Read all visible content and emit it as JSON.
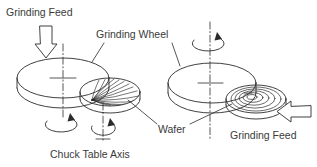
{
  "figure": {
    "title": "",
    "background_color": "#ffffff",
    "line_color": "#2b2b2b",
    "text_color": "#3a3a3a",
    "width": 317,
    "height": 167
  },
  "labels": {
    "grinding_feed_top": "Grinding Feed",
    "grinding_wheel": "Grinding Wheel",
    "wafer": "Wafer",
    "chuck_table_axis": "Chuck Table Axis",
    "grinding_feed_right": "Grinding Feed"
  },
  "icons": {
    "feed_arrow_down": "down-block-arrow-icon",
    "feed_arrow_left": "left-block-arrow-icon",
    "rotation_wheel_left": "rotation-arrow-icon",
    "rotation_chuck_left": "rotation-arrow-icon",
    "rotation_wheel_right": "rotation-arrow-icon"
  },
  "assemblies": [
    {
      "name": "left-assembly",
      "description": "Vertical in-feed grinding configuration",
      "grinding_wheel": {
        "cx": 63,
        "cy": 78,
        "rx": 46,
        "ry": 20,
        "thickness": 10
      },
      "wafer": {
        "cx": 110,
        "cy": 93,
        "rx": 30,
        "ry": 14,
        "hatching": "radial-spiral"
      },
      "feed_direction": "down",
      "axis_style": "dash-dot"
    },
    {
      "name": "right-assembly",
      "description": "Horizontal creep-feed grinding configuration",
      "grinding_wheel": {
        "cx": 212,
        "cy": 83,
        "rx": 44,
        "ry": 20,
        "thickness": 10
      },
      "wafer": {
        "cx": 255,
        "cy": 100,
        "rx": 30,
        "ry": 14,
        "hatching": "concentric-arcs"
      },
      "feed_direction": "left",
      "axis_style": "dash-dot"
    }
  ]
}
